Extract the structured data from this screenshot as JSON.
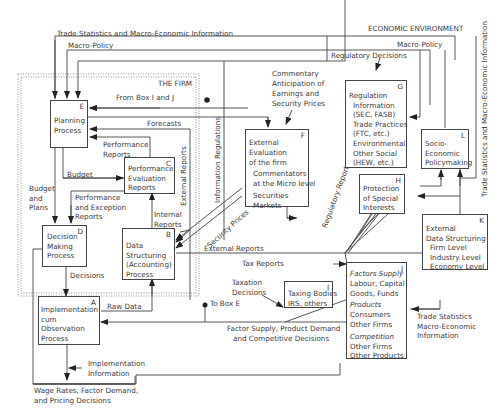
{
  "diagram": {
    "regions": {
      "firm": "THE FIRM",
      "environment": "ECONOMIC ENVIRONMENT"
    },
    "boxes": {
      "A": {
        "letter": "A",
        "lines": [
          "Implementation",
          "cum",
          "Observation",
          "Process"
        ]
      },
      "B": {
        "letter": "B",
        "lines": [
          "Data",
          "Structuring",
          "(Accounting)",
          "Process"
        ]
      },
      "C": {
        "letter": "C",
        "lines": [
          "Performance",
          "Evaluation",
          "Reports"
        ]
      },
      "D": {
        "letter": "D",
        "lines": [
          "Decision",
          "Making",
          "Process"
        ]
      },
      "E": {
        "letter": "E",
        "lines": [
          "Planning",
          "Process"
        ]
      },
      "F": {
        "letter": "F",
        "lines": [
          "External",
          "Evaluation",
          "of the firm"
        ],
        "sub1": [
          "Commentators",
          "at the Micro level"
        ],
        "sub2": [
          "Securities",
          "Markets"
        ]
      },
      "G": {
        "letter": "G",
        "lines": [
          "Regulation"
        ],
        "sub": [
          "Information",
          "(SEC, FASB)",
          "Trade Practices",
          "(FTC, etc.)",
          "Environmental,",
          "Other Social",
          "(HEW, etc.)"
        ]
      },
      "H": {
        "letter": "H",
        "lines": [
          "Protection",
          "of Special",
          "Interests"
        ]
      },
      "I": {
        "letter": "I",
        "lines": [
          "Taxing Bodies",
          "IRS, others"
        ]
      },
      "J": {
        "letter": "J",
        "h1": "Factors Supply",
        "s1": [
          "Labour, Capital",
          "Goods, Funds"
        ],
        "h2": "Products",
        "s2": [
          "Consumers",
          "Other Firms"
        ],
        "h3": "Competition",
        "s3": [
          "Other Firms",
          "Other Products"
        ]
      },
      "K": {
        "letter": "K",
        "lines": [
          "External",
          "Data Structuring"
        ],
        "sub": [
          "Firm Level",
          "Industry Level",
          "Economy Level"
        ]
      },
      "L": {
        "letter": "L",
        "lines": [
          "Socio-",
          "Economic",
          "Policymaking"
        ]
      }
    },
    "flows": {
      "trade_stats_top": "Trade Statistics and Macro-Economic Information",
      "macro_policy_left": "Macro-Policy",
      "macro_policy_right": "Macro-Policy",
      "regulatory_decisions": "Regulatory Decisions",
      "commentary": [
        "Commentary",
        "Anticipation of",
        "Earnings and",
        "Security Prices"
      ],
      "from_box_ij": "From Box I and J",
      "forecasts": "Forecasts",
      "performance_reports": [
        "Performance",
        "Reports"
      ],
      "budget": "Budget",
      "budget_and_plans": [
        "Budget",
        "and",
        "Plans"
      ],
      "perf_exception_reports": [
        "Performance",
        "and Exception",
        "Reports"
      ],
      "external_reports_vert": "External Reports",
      "information_regulations": "Information Regulations",
      "internal_reports": [
        "Internal",
        "Reports"
      ],
      "security_prices": "Security Prices",
      "regulatory_reports": "Regulatory  Reports",
      "external_reports_h": "External Reports",
      "tax_reports": "Tax Reports",
      "taxation_decisions": [
        "Taxation",
        "Decisions"
      ],
      "to_box_e": "To Box E",
      "decisions": "Decisions",
      "raw_data": "Raw Data",
      "factor_supply": [
        "Factor Supply, Product Demand",
        "and Competitive Decisions"
      ],
      "implementation_info": [
        "Implementation",
        "Information"
      ],
      "wage_rates": [
        "Wage Rates, Factor Demand,",
        "and Pricing Decisions"
      ],
      "trade_stats_right": [
        "Trade Statistics",
        "Macro-Economic",
        "Information"
      ],
      "trade_stats_vert": "Trade Statistics and Macro-Economic Information"
    }
  }
}
